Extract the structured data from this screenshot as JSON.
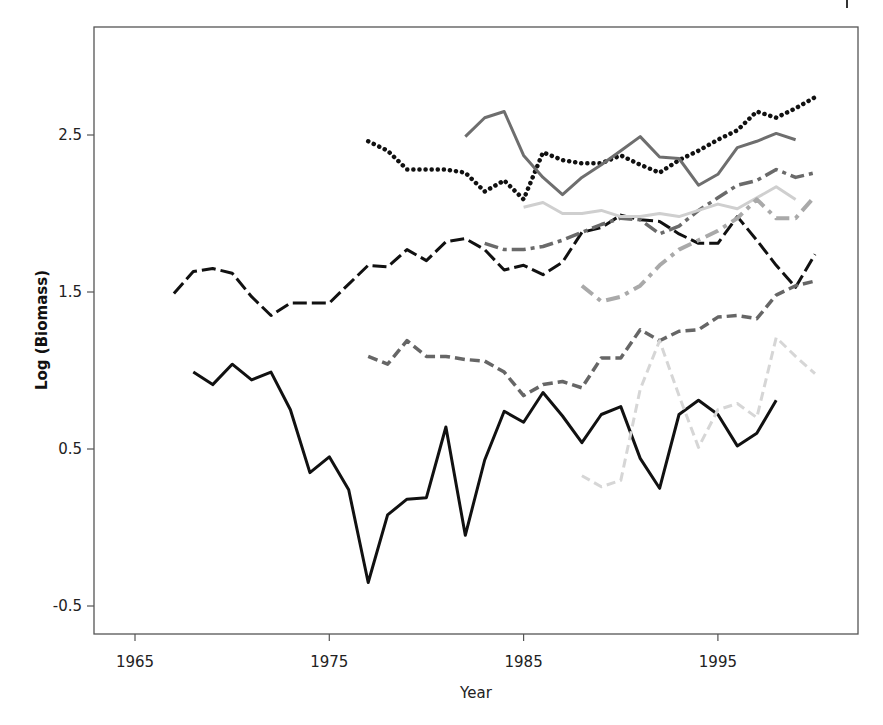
{
  "chart_data": {
    "type": "line",
    "title": "",
    "xlabel": "Year",
    "ylabel": "Log (Biomass)",
    "xlim": [
      1962,
      2002
    ],
    "ylim": [
      -0.68,
      3.2
    ],
    "xticks": [
      1965,
      1975,
      1985,
      1995
    ],
    "yticks": [
      -0.5,
      0.5,
      1.5,
      2.5
    ],
    "xtick_labels": [
      "1965",
      "1975",
      "1985",
      "1995"
    ],
    "ytick_labels": [
      "-0.5",
      "0.5",
      "1.5",
      "2.5"
    ],
    "grid": false,
    "legend": null,
    "series": [
      {
        "name": "series-black-longdash",
        "color": "#111111",
        "dash": "14,5",
        "width": 3,
        "x": [
          1967,
          1968,
          1969,
          1970,
          1971,
          1972,
          1973,
          1974,
          1975,
          1976,
          1977,
          1978,
          1979,
          1980,
          1981,
          1982,
          1983,
          1984,
          1985,
          1986,
          1987,
          1988,
          1989,
          1990,
          1991,
          1992,
          1993,
          1994,
          1995,
          1996,
          1997,
          1998,
          1999,
          2000
        ],
        "y": [
          1.49,
          1.63,
          1.65,
          1.62,
          1.47,
          1.35,
          1.43,
          1.43,
          1.43,
          1.55,
          1.67,
          1.66,
          1.77,
          1.7,
          1.82,
          1.84,
          1.77,
          1.64,
          1.67,
          1.61,
          1.69,
          1.88,
          1.91,
          1.99,
          1.96,
          1.95,
          1.87,
          1.81,
          1.81,
          1.98,
          1.83,
          1.67,
          1.53,
          1.74
        ]
      },
      {
        "name": "series-black-solid",
        "color": "#111111",
        "dash": "",
        "width": 3,
        "x": [
          1968,
          1969,
          1970,
          1971,
          1972,
          1973,
          1974,
          1975,
          1976,
          1977,
          1978,
          1979,
          1980,
          1981,
          1982,
          1983,
          1984,
          1985,
          1986,
          1987,
          1988,
          1989,
          1990,
          1991,
          1992,
          1993,
          1994,
          1995,
          1996,
          1997,
          1998
        ],
        "y": [
          0.99,
          0.91,
          1.04,
          0.94,
          0.99,
          0.75,
          0.35,
          0.45,
          0.24,
          -0.35,
          0.08,
          0.18,
          0.19,
          0.64,
          -0.05,
          0.43,
          0.74,
          0.67,
          0.86,
          0.71,
          0.54,
          0.72,
          0.77,
          0.44,
          0.25,
          0.72,
          0.81,
          0.72,
          0.52,
          0.6,
          0.81
        ]
      },
      {
        "name": "series-black-dotted",
        "color": "#111111",
        "dash": "0.1,6",
        "width": 4.5,
        "linecap": "round",
        "x": [
          1977,
          1978,
          1979,
          1980,
          1981,
          1982,
          1983,
          1984,
          1985,
          1986,
          1987,
          1988,
          1989,
          1990,
          1991,
          1992,
          1993,
          1994,
          1995,
          1996,
          1997,
          1998,
          1999,
          2000
        ],
        "y": [
          2.46,
          2.4,
          2.28,
          2.28,
          2.28,
          2.26,
          2.14,
          2.21,
          2.09,
          2.39,
          2.34,
          2.32,
          2.32,
          2.37,
          2.31,
          2.26,
          2.34,
          2.4,
          2.47,
          2.53,
          2.65,
          2.61,
          2.67,
          2.74
        ]
      },
      {
        "name": "series-gray-solid",
        "color": "#6e6e6e",
        "dash": "",
        "width": 3,
        "x": [
          1982,
          1983,
          1984,
          1985,
          1986,
          1987,
          1988,
          1989,
          1990,
          1991,
          1992,
          1993,
          1994,
          1995,
          1996,
          1997,
          1998,
          1999
        ],
        "y": [
          2.49,
          2.61,
          2.65,
          2.37,
          2.23,
          2.12,
          2.23,
          2.31,
          2.4,
          2.49,
          2.36,
          2.35,
          2.18,
          2.25,
          2.42,
          2.46,
          2.51,
          2.47
        ]
      },
      {
        "name": "series-gray-dashed",
        "color": "#666666",
        "dash": "10,5",
        "width": 3.5,
        "x": [
          1977,
          1978,
          1979,
          1980,
          1981,
          1982,
          1983,
          1984,
          1985,
          1986,
          1987,
          1988,
          1989,
          1990,
          1991,
          1992,
          1993,
          1994,
          1995,
          1996,
          1997,
          1998,
          1999,
          2000
        ],
        "y": [
          1.09,
          1.04,
          1.19,
          1.09,
          1.09,
          1.07,
          1.06,
          0.99,
          0.84,
          0.91,
          0.93,
          0.89,
          1.08,
          1.08,
          1.26,
          1.19,
          1.25,
          1.26,
          1.34,
          1.35,
          1.33,
          1.48,
          1.54,
          1.57
        ]
      },
      {
        "name": "series-gray-dashdot",
        "color": "#6a6a6a",
        "dash": "14,5,4,5",
        "width": 3.5,
        "x": [
          1983,
          1984,
          1985,
          1986,
          1987,
          1988,
          1989,
          1990,
          1991,
          1992,
          1993,
          1994,
          1995,
          1996,
          1997,
          1998,
          1999,
          2000
        ],
        "y": [
          1.81,
          1.77,
          1.77,
          1.79,
          1.83,
          1.88,
          1.93,
          1.97,
          1.96,
          1.87,
          1.92,
          2.02,
          2.1,
          2.18,
          2.21,
          2.28,
          2.23,
          2.26
        ]
      },
      {
        "name": "series-lightgray-solid",
        "color": "#cfcfcf",
        "dash": "",
        "width": 3,
        "x": [
          1985,
          1986,
          1987,
          1988,
          1989,
          1990,
          1991,
          1992,
          1993,
          1994,
          1995,
          1996,
          1997,
          1998,
          1999
        ],
        "y": [
          2.04,
          2.07,
          2.0,
          2.0,
          2.02,
          1.98,
          1.98,
          2.0,
          1.98,
          2.02,
          2.06,
          2.03,
          2.1,
          2.17,
          2.09
        ]
      },
      {
        "name": "series-lightgray-dashdot",
        "color": "#a9a9a9",
        "dash": "14,6,4,6",
        "width": 4,
        "x": [
          1988,
          1989,
          1990,
          1991,
          1992,
          1993,
          1994,
          1995,
          1996,
          1997,
          1998,
          1999,
          2000
        ],
        "y": [
          1.54,
          1.44,
          1.47,
          1.54,
          1.67,
          1.77,
          1.83,
          1.89,
          1.97,
          2.09,
          1.97,
          1.97,
          2.11
        ]
      },
      {
        "name": "series-verylightgray-dashed",
        "color": "#d6d6d6",
        "dash": "9,5",
        "width": 3,
        "x": [
          1988,
          1989,
          1990,
          1991,
          1992,
          1993,
          1994,
          1995,
          1996,
          1997,
          1998,
          1999,
          2000
        ],
        "y": [
          0.33,
          0.26,
          0.3,
          0.88,
          1.19,
          0.84,
          0.51,
          0.75,
          0.79,
          0.7,
          1.21,
          1.09,
          0.98
        ]
      }
    ]
  },
  "axes": {
    "x_title": "Year",
    "y_title": "Log (Biomass)"
  }
}
